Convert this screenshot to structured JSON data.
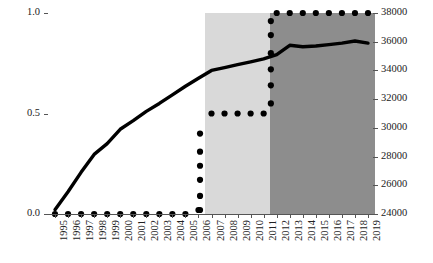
{
  "chart_data": {
    "type": "line",
    "title": "",
    "subtitle": "",
    "xlabel": "",
    "ylabel": "",
    "grid": false,
    "legend": "none",
    "categories": [
      "1995",
      "1996",
      "1997",
      "1998",
      "1999",
      "2000",
      "2001",
      "2002",
      "2003",
      "2004",
      "2005",
      "2006",
      "2007",
      "2008",
      "2009",
      "2010",
      "2011",
      "2012",
      "2013",
      "2014",
      "2015",
      "2016",
      "2017",
      "2018",
      "2019"
    ],
    "axes": {
      "left": {
        "ticks": [
          "0.0",
          "0.5",
          "1.0"
        ],
        "values": [
          0.0,
          0.5,
          1.0
        ],
        "ylim": [
          0.0,
          1.0
        ]
      },
      "right": {
        "ticks": [
          "24000",
          "26000",
          "28000",
          "30000",
          "32000",
          "34000",
          "36000",
          "38000"
        ],
        "values": [
          24000,
          26000,
          28000,
          30000,
          32000,
          34000,
          36000,
          38000
        ],
        "ylim": [
          24000,
          38000
        ]
      }
    },
    "series": [
      {
        "name": "solid-line",
        "style": "solid",
        "axis": "right",
        "color": "#000000",
        "values": [
          24300,
          25550,
          26900,
          28150,
          28900,
          29900,
          30500,
          31150,
          31700,
          32300,
          32900,
          33450,
          34000,
          34200,
          34400,
          34600,
          34800,
          35100,
          35750,
          35650,
          35700,
          35800,
          35900,
          36050,
          35900
        ]
      },
      {
        "name": "dotted-series",
        "style": "dotted",
        "axis": "left",
        "color": "#000000",
        "values": [
          0.0,
          0.0,
          0.0,
          0.0,
          0.0,
          0.0,
          0.0,
          0.0,
          0.0,
          0.0,
          0.0,
          0.02,
          0.5,
          0.5,
          0.5,
          0.5,
          0.5,
          1.0,
          1.0,
          1.0,
          1.0,
          1.0,
          1.0,
          1.0,
          1.0
        ]
      }
    ],
    "dotted_riser_2006": [
      0.02,
      0.09,
      0.17,
      0.24,
      0.31,
      0.4
    ],
    "dotted_riser_2011": [
      0.55,
      0.64,
      0.72,
      0.8,
      0.89,
      0.96
    ],
    "shaded_bands": [
      {
        "name": "light-band",
        "from": "2007",
        "to": "2012",
        "color": "#d9d9d9"
      },
      {
        "name": "dark-band",
        "from": "2012",
        "to": "2019",
        "color": "#8d8d8d"
      }
    ]
  }
}
